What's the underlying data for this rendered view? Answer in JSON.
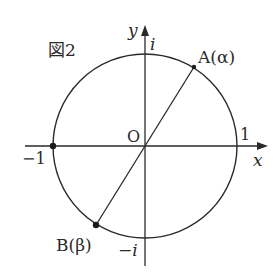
{
  "figure": {
    "caption": "図2",
    "colors": {
      "stroke": "#2a2a2a",
      "background": "#ffffff"
    }
  },
  "axes": {
    "x_label": "x",
    "y_label": "y",
    "origin_label": "O"
  },
  "unit_circle_labels": {
    "pos_real": "1",
    "neg_real": "−1",
    "pos_imag": "i",
    "neg_imag": "−i"
  },
  "points": {
    "A": {
      "label": "A(α)"
    },
    "B": {
      "label": "B(β)"
    }
  }
}
